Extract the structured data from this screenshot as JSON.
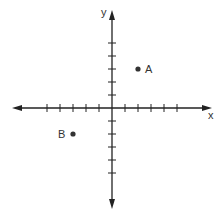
{
  "diagram": {
    "type": "coordinate-plane",
    "axes": {
      "x_label": "x",
      "y_label": "y",
      "x_ticks": [
        -5,
        -4,
        -3,
        -2,
        -1,
        1,
        2,
        3,
        4,
        5
      ],
      "y_ticks": [
        -5,
        -4,
        -3,
        -2,
        -1,
        1,
        2,
        3,
        4,
        5
      ],
      "tick_labels_shown": false,
      "arrows_both_ends": true
    },
    "points": [
      {
        "label": "A",
        "x": 2,
        "y": 3
      },
      {
        "label": "B",
        "x": -3,
        "y": -2
      }
    ],
    "colors": {
      "axis": "#222222",
      "point": "#333333",
      "background": "#ffffff"
    }
  }
}
